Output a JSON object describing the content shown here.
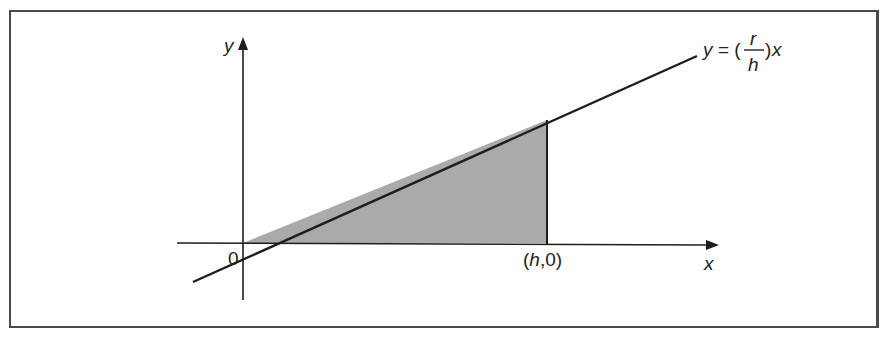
{
  "diagram": {
    "axes": {
      "x_label": "x",
      "y_label": "y",
      "origin_label": "0"
    },
    "line": {
      "equation_prefix": "y = (",
      "numerator": "r",
      "denominator": "h",
      "equation_suffix": ")x"
    },
    "point_label": {
      "open": "(",
      "var": "h",
      "rest": ",0)"
    },
    "colors": {
      "shade": "#aaaaaa",
      "stroke": "#1e1e1e",
      "frame": "#4a4a4a"
    }
  }
}
